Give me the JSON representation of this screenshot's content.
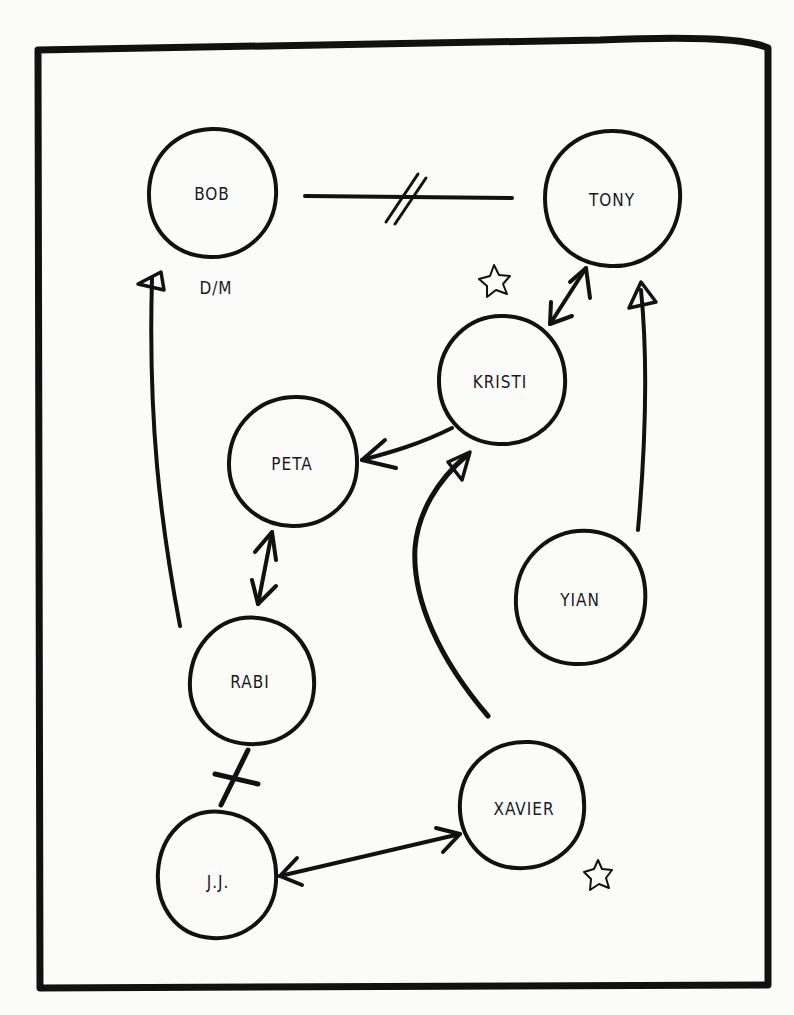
{
  "diagram": {
    "type": "sociogram",
    "colors": {
      "ink": "#111111",
      "paper": "#fbfbfa"
    },
    "nodes": [
      {
        "id": "bob",
        "label": "BOB",
        "cx": 212,
        "cy": 193,
        "r": 64,
        "annotation": "D/M"
      },
      {
        "id": "tony",
        "label": "TONY",
        "cx": 612,
        "cy": 198,
        "r": 68
      },
      {
        "id": "kristi",
        "label": "KRISTI",
        "cx": 500,
        "cy": 381,
        "r": 64,
        "star": true
      },
      {
        "id": "peta",
        "label": "PETA",
        "cx": 293,
        "cy": 463,
        "r": 65
      },
      {
        "id": "yian",
        "label": "YIAN",
        "cx": 577,
        "cy": 598,
        "r": 67
      },
      {
        "id": "rabi",
        "label": "RABI",
        "cx": 245,
        "cy": 681,
        "r": 63
      },
      {
        "id": "xavier",
        "label": "XAVIER",
        "cx": 522,
        "cy": 808,
        "r": 65,
        "star": true
      },
      {
        "id": "jj",
        "label": "J.J.",
        "cx": 215,
        "cy": 879,
        "r": 65
      }
    ],
    "edges": [
      {
        "from": "bob",
        "to": "tony",
        "kind": "conflict",
        "marker": "double-slash"
      },
      {
        "from": "kristi",
        "to": "tony",
        "kind": "mutual",
        "marker": "double-arrow"
      },
      {
        "from": "yian",
        "to": "tony",
        "kind": "one-way",
        "marker": "open-arrow"
      },
      {
        "from": "kristi",
        "to": "peta",
        "kind": "one-way",
        "marker": "arrow"
      },
      {
        "from": "xavier",
        "to": "kristi",
        "kind": "one-way",
        "marker": "open-arrow"
      },
      {
        "from": "peta",
        "to": "rabi",
        "kind": "mutual",
        "marker": "double-arrow"
      },
      {
        "from": "rabi",
        "to": "bob",
        "kind": "one-way",
        "marker": "open-arrow"
      },
      {
        "from": "rabi",
        "to": "jj",
        "kind": "conflict",
        "marker": "single-slash"
      },
      {
        "from": "jj",
        "to": "xavier",
        "kind": "mutual",
        "marker": "double-arrow"
      }
    ],
    "annotations": {
      "bob_note": "D/M",
      "stars": [
        "near-kristi",
        "near-xavier"
      ]
    },
    "labels": {
      "bob": "BOB",
      "tony": "TONY",
      "kristi": "KRISTI",
      "peta": "PETA",
      "yian": "YIAN",
      "rabi": "RABI",
      "xavier": "XAVIER",
      "jj": "J.J.",
      "bob_note": "D/M"
    }
  }
}
